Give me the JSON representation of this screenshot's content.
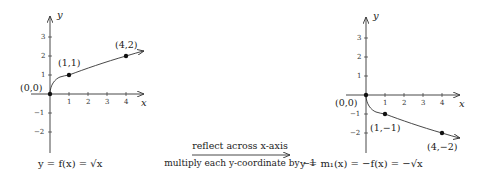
{
  "left_graph": {
    "caption": "y = f(x) = √x",
    "axis_x_label": "x",
    "axis_y_label": "y",
    "x_ticks": [
      "1",
      "2",
      "3",
      "4"
    ],
    "y_ticks_pos": [
      "1",
      "2",
      "3"
    ],
    "y_ticks_neg": [
      "−1",
      "−2"
    ],
    "points": [
      {
        "label": "(0,0)"
      },
      {
        "label": "(1,1)"
      },
      {
        "label": "(4,2)"
      }
    ]
  },
  "right_graph": {
    "caption": "y = m₁(x) = −f(x) = −√x",
    "axis_x_label": "x",
    "axis_y_label": "y",
    "x_ticks": [
      "1",
      "2",
      "3",
      "4"
    ],
    "y_ticks_pos": [
      "1",
      "2",
      "3"
    ],
    "y_ticks_neg": [
      "−1",
      "−2"
    ],
    "points": [
      {
        "label": "(0,0)"
      },
      {
        "label": "(1,−1)"
      },
      {
        "label": "(4,−2)"
      }
    ]
  },
  "transform": {
    "top_text": "reflect across x-axis",
    "bottom_text": "multiply each y-coordinate by −1"
  }
}
